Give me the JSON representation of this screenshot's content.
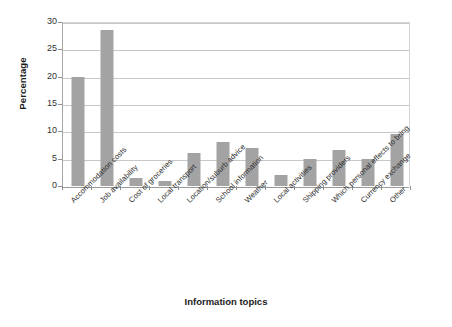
{
  "chart_data": {
    "type": "bar",
    "title": "",
    "xlabel": "Information topics",
    "ylabel": "Percentage",
    "ylim": [
      0,
      30
    ],
    "yticks": [
      0,
      5,
      10,
      15,
      20,
      25,
      30
    ],
    "ytick_labels": [
      "0",
      "5",
      "10",
      "15",
      "20",
      "25",
      "30"
    ],
    "grid": true,
    "legend": "none",
    "bar_color": "#a3a3a3",
    "categories": [
      "Accommodation costs",
      "Job availability",
      "Cost of groceries",
      "Local transport",
      "Location/suburb advice",
      "School information",
      "Weather",
      "Local activities",
      "Shipping providers",
      "Which personal effects to bring",
      "Currency exchange",
      "Other"
    ],
    "values": [
      20,
      28.5,
      1.5,
      1,
      6,
      8,
      7,
      2,
      5,
      6.5,
      5,
      9.5
    ]
  }
}
